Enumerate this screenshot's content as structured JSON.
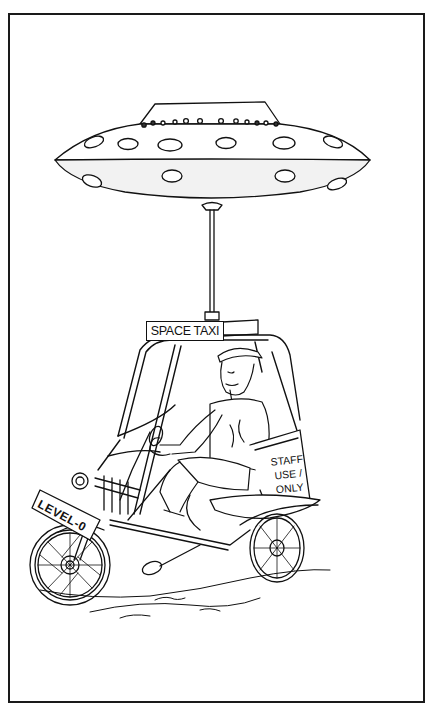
{
  "illustration": {
    "subject": "Space taxi tricycle with flying saucer on a pole",
    "colors": {
      "ink": "#111111",
      "paper": "#ffffff",
      "saucer_shade": "#f2f2f2"
    },
    "labels": {
      "roof_sign": "SPACE TAXI",
      "license_plate": "LEVEL-0",
      "rear_box_line1": "STAFF",
      "rear_box_line2": "USE /",
      "rear_box_line3": "ONLY"
    }
  }
}
